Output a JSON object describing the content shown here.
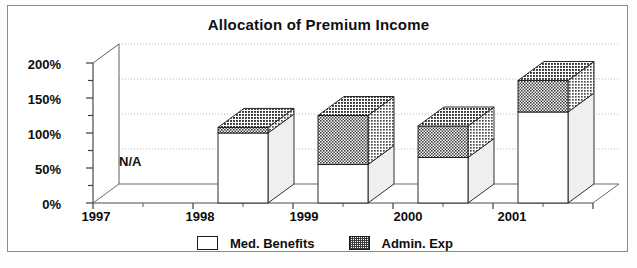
{
  "chart_data": {
    "type": "bar",
    "title": "Allocation of Premium Income",
    "xlabel": "",
    "ylabel": "",
    "categories": [
      "1997",
      "1998",
      "1999",
      "2000",
      "2001"
    ],
    "series": [
      {
        "name": "Med. Benefits",
        "values": [
          null,
          100,
          55,
          65,
          130
        ],
        "swatch": "white"
      },
      {
        "name": "Admin. Exp",
        "values": [
          null,
          8,
          70,
          45,
          45
        ],
        "swatch": "hatch"
      }
    ],
    "stacked": true,
    "totals": [
      null,
      108,
      125,
      110,
      175
    ],
    "ylim": [
      0,
      200
    ],
    "yticks": [
      "0%",
      "50%",
      "100%",
      "150%",
      "200%"
    ],
    "ytick_values": [
      0,
      50,
      100,
      150,
      200
    ],
    "minor_tick_interval": 25,
    "grid": "horizontal-dotted",
    "legend_position": "bottom",
    "three_d": true,
    "annotations": [
      {
        "text": "N/A",
        "category": "1997",
        "value": 50
      }
    ],
    "colors": {
      "med_benefits": "#ffffff",
      "admin_exp": "#4a4a4a",
      "outline": "#1a1a1a",
      "grid": "#b9b9b9",
      "frame": "#8a8a8a",
      "text": "#0d0d0d",
      "background": "#ffffff"
    }
  },
  "yaxis": {
    "ticks": [
      {
        "label": "200%"
      },
      {
        "label": "150%"
      },
      {
        "label": "100%"
      },
      {
        "label": "50%"
      },
      {
        "label": "0%"
      }
    ]
  },
  "xaxis": {
    "ticks": [
      {
        "label": "1997"
      },
      {
        "label": "1998"
      },
      {
        "label": "1999"
      },
      {
        "label": "2000"
      },
      {
        "label": "2001"
      }
    ]
  },
  "annotations": {
    "na": "N/A"
  },
  "legend": {
    "items": [
      {
        "label": "Med. Benefits"
      },
      {
        "label": "Admin. Exp"
      }
    ]
  }
}
